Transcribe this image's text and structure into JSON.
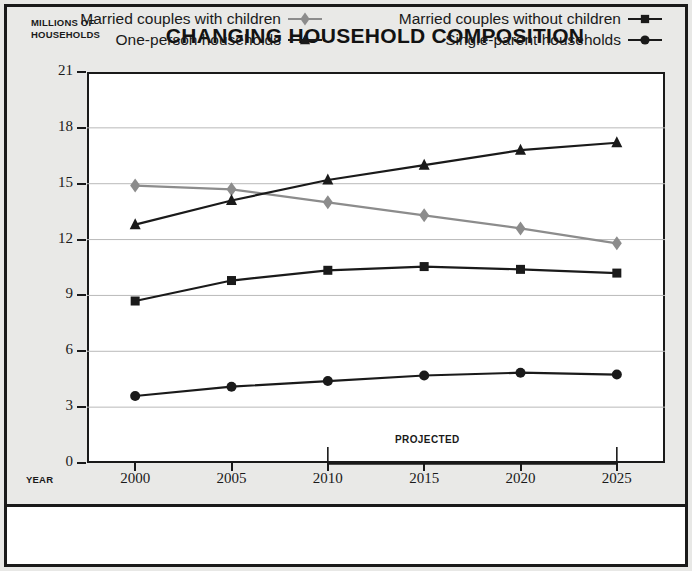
{
  "figure": {
    "title": "CHANGING HOUSEHOLD COMPOSITION",
    "y_axis_caption": "MILLIONS OF\nHOUSEHOLDS",
    "x_axis_caption": "YEAR",
    "projected_label": "PROJECTED"
  },
  "legend": [
    {
      "label": "Married couples with children",
      "marker": "diamond-icon",
      "color": "#8c8c8c"
    },
    {
      "label": "Married couples without children",
      "marker": "square-icon",
      "color": "#1a1a1a"
    },
    {
      "label": "One-person households",
      "marker": "triangle-icon",
      "color": "#1a1a1a"
    },
    {
      "label": "Single-parent households",
      "marker": "circle-icon",
      "color": "#1a1a1a"
    }
  ],
  "chart_data": {
    "type": "line",
    "title": "CHANGING HOUSEHOLD COMPOSITION",
    "xlabel": "YEAR",
    "ylabel": "MILLIONS OF HOUSEHOLDS",
    "x": [
      2000,
      2005,
      2010,
      2015,
      2020,
      2025
    ],
    "xtick_labels": [
      "2000",
      "2005",
      "2010",
      "2015",
      "2020",
      "2025"
    ],
    "ytick_labels": [
      "0",
      "3",
      "6",
      "9",
      "12",
      "15",
      "18",
      "21"
    ],
    "yticks": [
      0,
      3,
      6,
      9,
      12,
      15,
      18,
      21
    ],
    "ylim": [
      0,
      21
    ],
    "xlim": [
      1997.5,
      2027.5
    ],
    "grid": "horizontal",
    "legend_position": "bottom",
    "annotations": [
      {
        "text": "PROJECTED",
        "x_start": 2010,
        "x_end": 2025,
        "note": "bracket spanning 2010 to 2025 along the x axis"
      }
    ],
    "series": [
      {
        "name": "Married couples with children",
        "marker": "diamond",
        "color": "#8c8c8c",
        "values": [
          14.9,
          14.7,
          14.0,
          13.3,
          12.6,
          11.8
        ]
      },
      {
        "name": "Married couples without children",
        "marker": "square",
        "color": "#1a1a1a",
        "values": [
          8.7,
          9.8,
          10.35,
          10.55,
          10.4,
          10.2
        ]
      },
      {
        "name": "One-person households",
        "marker": "triangle",
        "color": "#1a1a1a",
        "values": [
          12.8,
          14.1,
          15.2,
          16.0,
          16.8,
          17.2
        ]
      },
      {
        "name": "Single-parent households",
        "marker": "circle",
        "color": "#1a1a1a",
        "values": [
          3.6,
          4.1,
          4.4,
          4.7,
          4.85,
          4.75
        ]
      }
    ]
  }
}
